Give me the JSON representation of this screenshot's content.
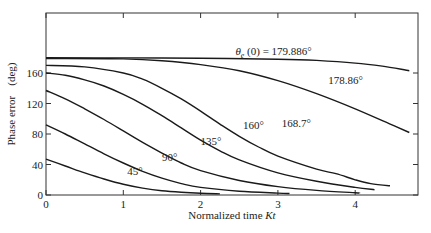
{
  "chart_data": {
    "type": "line",
    "title": "",
    "xlabel": "Normalized time Kt",
    "xlabel_plain": "Normalized time ",
    "xlabel_italic": "Kt",
    "ylabel": "Phase error (deg)",
    "ylabel_main": "Phase error",
    "ylabel_unit": "(deg)",
    "xlim": [
      0,
      4.8
    ],
    "ylim": [
      0,
      200
    ],
    "x_ticks": [
      0,
      1,
      2,
      3,
      4
    ],
    "y_ticks": [
      0,
      40,
      80,
      120,
      160
    ],
    "grid": false,
    "legend": "none (inline curve labels)",
    "series": [
      {
        "name": "45°",
        "label": "45°",
        "initial_deg": 45,
        "points": [
          [
            0,
            47
          ],
          [
            0.25,
            38
          ],
          [
            0.5,
            29
          ],
          [
            0.75,
            21
          ],
          [
            1,
            14
          ],
          [
            1.25,
            9
          ],
          [
            1.5,
            5.5
          ],
          [
            1.75,
            3.5
          ],
          [
            2,
            2.2
          ],
          [
            2.25,
            1.5
          ]
        ]
      },
      {
        "name": "90°",
        "label": "90°",
        "initial_deg": 90,
        "points": [
          [
            0,
            92
          ],
          [
            0.25,
            80
          ],
          [
            0.5,
            67
          ],
          [
            0.75,
            54
          ],
          [
            1,
            42
          ],
          [
            1.25,
            31
          ],
          [
            1.5,
            22
          ],
          [
            1.75,
            15
          ],
          [
            2,
            10
          ],
          [
            2.5,
            5
          ],
          [
            3,
            2.5
          ],
          [
            3.15,
            2
          ]
        ]
      },
      {
        "name": "135°",
        "label": "135°",
        "initial_deg": 135,
        "points": [
          [
            0,
            137
          ],
          [
            0.25,
            126
          ],
          [
            0.5,
            113
          ],
          [
            0.75,
            99
          ],
          [
            1,
            84
          ],
          [
            1.25,
            69
          ],
          [
            1.5,
            55
          ],
          [
            1.75,
            42
          ],
          [
            2,
            32
          ],
          [
            2.5,
            19
          ],
          [
            3,
            11
          ],
          [
            3.5,
            6
          ],
          [
            4,
            3
          ],
          [
            4.05,
            2.5
          ]
        ]
      },
      {
        "name": "160°",
        "label": "160°",
        "initial_deg": 160,
        "points": [
          [
            0,
            160
          ],
          [
            0.25,
            157
          ],
          [
            0.5,
            151
          ],
          [
            0.75,
            143
          ],
          [
            1,
            132
          ],
          [
            1.25,
            119
          ],
          [
            1.5,
            104
          ],
          [
            1.75,
            88
          ],
          [
            2,
            72
          ],
          [
            2.25,
            58
          ],
          [
            2.5,
            46
          ],
          [
            3,
            29
          ],
          [
            3.5,
            18
          ],
          [
            4,
            10
          ],
          [
            4.25,
            7
          ]
        ]
      },
      {
        "name": "168.7°",
        "label": "168.7°",
        "initial_deg": 168.7,
        "points": [
          [
            0,
            170
          ],
          [
            0.5,
            168
          ],
          [
            1,
            160
          ],
          [
            1.25,
            152
          ],
          [
            1.5,
            140
          ],
          [
            1.75,
            126
          ],
          [
            2,
            110
          ],
          [
            2.25,
            93
          ],
          [
            2.5,
            77
          ],
          [
            2.75,
            63
          ],
          [
            3,
            51
          ],
          [
            3.5,
            34
          ],
          [
            3.75,
            28
          ],
          [
            4,
            20
          ],
          [
            4.2,
            15
          ],
          [
            4.45,
            12
          ]
        ]
      },
      {
        "name": "178.86°",
        "label": "178.86°",
        "initial_deg": 178.86,
        "points": [
          [
            0,
            179
          ],
          [
            1,
            178.5
          ],
          [
            1.5,
            176
          ],
          [
            2,
            171
          ],
          [
            2.5,
            163
          ],
          [
            3,
            150
          ],
          [
            3.5,
            133
          ],
          [
            4,
            113
          ],
          [
            4.5,
            91
          ],
          [
            4.7,
            82
          ]
        ]
      },
      {
        "name": "θe(0) = 179.886°",
        "label": "θe (0) = 179.886°",
        "initial_deg": 179.886,
        "points": [
          [
            0,
            179.9
          ],
          [
            1,
            179.8
          ],
          [
            2,
            179.3
          ],
          [
            3,
            178
          ],
          [
            3.5,
            176.5
          ],
          [
            4,
            173
          ],
          [
            4.35,
            169
          ],
          [
            4.7,
            163
          ]
        ]
      }
    ],
    "annotations": [
      {
        "text": "45°",
        "x": 1.05,
        "y": 26
      },
      {
        "text": "90°",
        "x": 1.5,
        "y": 44
      },
      {
        "text": "135°",
        "x": 2.0,
        "y": 66
      },
      {
        "text": "160°",
        "x": 2.55,
        "y": 86
      },
      {
        "text": "168.7°",
        "x": 3.05,
        "y": 89
      },
      {
        "text": "178.86°",
        "x": 3.65,
        "y": 146
      },
      {
        "theta": "θ",
        "sub": "e",
        "rest": " (0) = 179.886°",
        "x": 2.45,
        "y": 184
      }
    ]
  }
}
